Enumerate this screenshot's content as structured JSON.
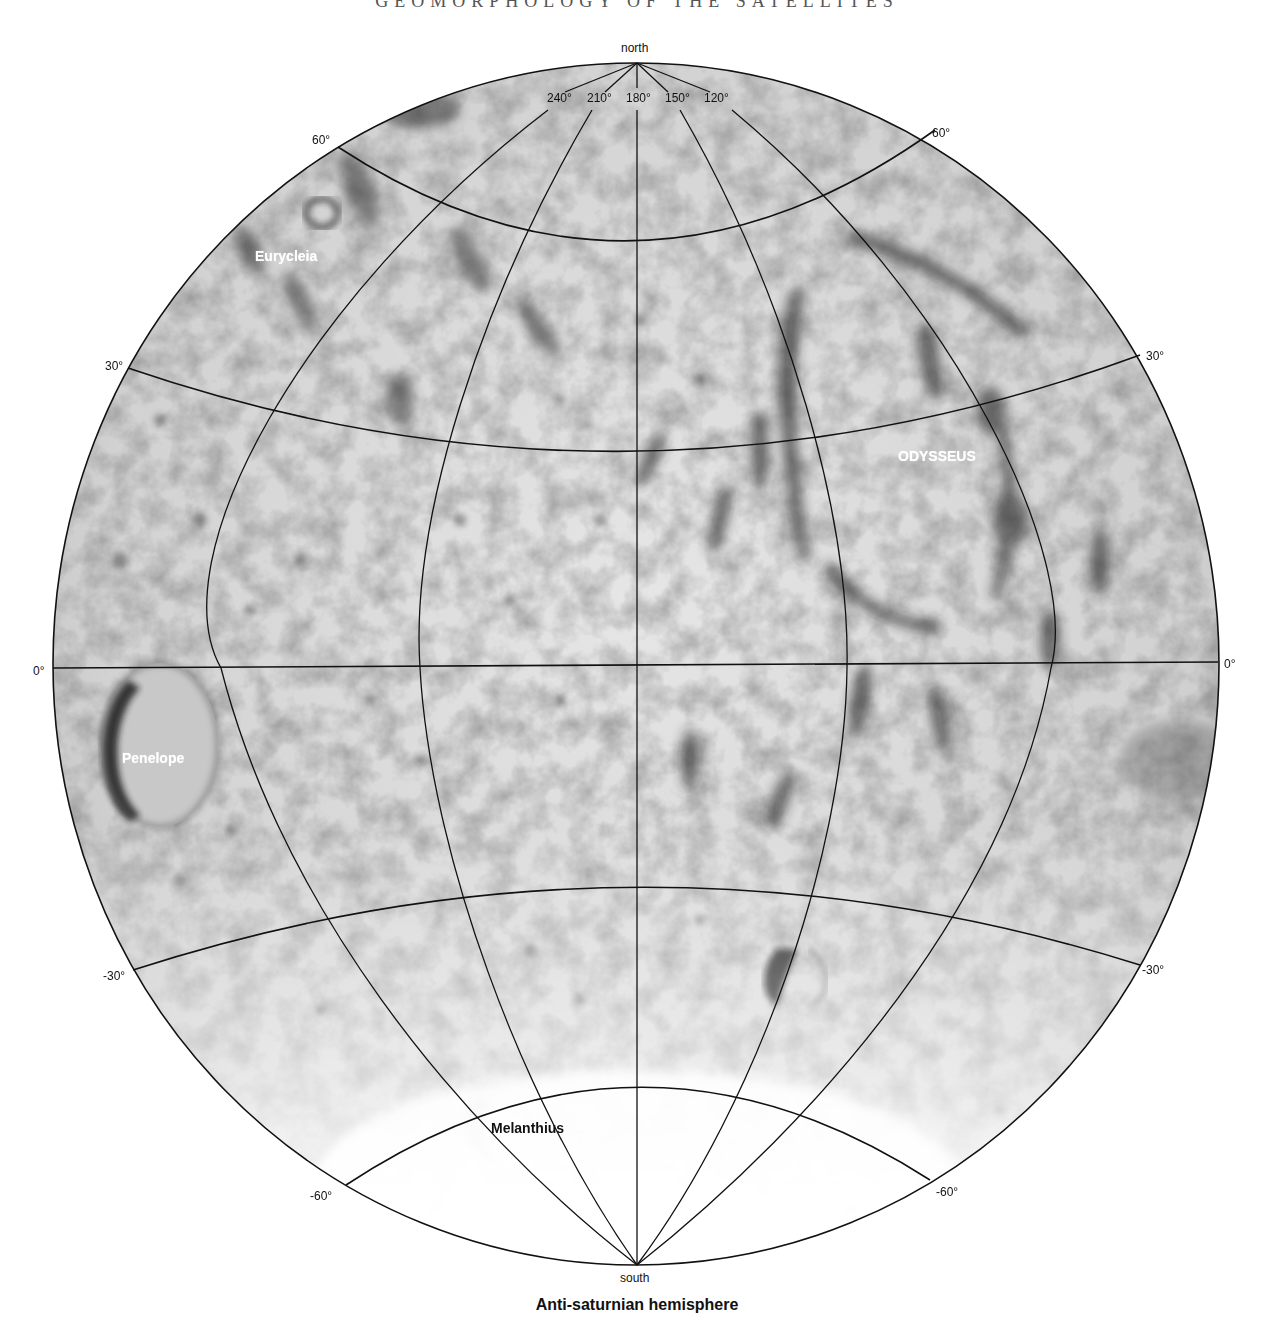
{
  "page": {
    "header": "GEOMORPHOLOGY OF THE SATELLITES",
    "caption": "Anti-saturnian hemisphere"
  },
  "map": {
    "poles": {
      "north": "north",
      "south": "south"
    },
    "longitude_labels": [
      "240°",
      "210°",
      "180°",
      "150°",
      "120°"
    ],
    "latitude_labels": {
      "n60_left": "60°",
      "n60_right": "60°",
      "n30_left": "30°",
      "n30_right": "30°",
      "eq_left": "0°",
      "eq_right": "0°",
      "s30_left": "-30°",
      "s30_right": "-30°",
      "s60_left": "-60°",
      "s60_right": "-60°"
    },
    "features": {
      "eurycleia": "Eurycleia",
      "odysseus": "ODYSSEUS",
      "penelope": "Penelope",
      "melanthius": "Melanthius"
    },
    "colors": {
      "grid": "#111111",
      "terrain_light": "#eeeeee",
      "terrain_dark": "#3a3a3a"
    }
  }
}
